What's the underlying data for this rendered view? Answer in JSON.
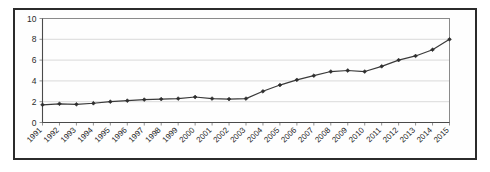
{
  "chart_data": {
    "type": "line",
    "title": "",
    "xlabel": "",
    "ylabel": "",
    "ylim": [
      0,
      10
    ],
    "yticks": [
      0,
      2,
      4,
      6,
      8,
      10
    ],
    "grid": true,
    "legend": "none",
    "categories": [
      "1991",
      "1992",
      "1993",
      "1994",
      "1995",
      "1996",
      "1997",
      "1998",
      "1999",
      "2000",
      "2001",
      "2002",
      "2003",
      "2004",
      "2005",
      "2006",
      "2007",
      "2008",
      "2009",
      "2010",
      "2011",
      "2012",
      "2013",
      "2014",
      "2015"
    ],
    "series": [
      {
        "name": "series-1",
        "marker": "diamond",
        "color": "#2e2e2e",
        "values": [
          1.7,
          1.8,
          1.75,
          1.85,
          2.0,
          2.1,
          2.2,
          2.25,
          2.3,
          2.45,
          2.3,
          2.25,
          2.3,
          3.0,
          3.6,
          4.1,
          4.5,
          4.9,
          5.0,
          4.9,
          5.4,
          6.0,
          6.4,
          7.0,
          8.0
        ]
      }
    ]
  },
  "axes": {
    "y_tick_labels": [
      "0",
      "2",
      "4",
      "6",
      "8",
      "10"
    ],
    "x_tick_labels": [
      "1991",
      "1992",
      "1993",
      "1994",
      "1995",
      "1996",
      "1997",
      "1998",
      "1999",
      "2000",
      "2001",
      "2002",
      "2003",
      "2004",
      "2005",
      "2006",
      "2007",
      "2008",
      "2009",
      "2010",
      "2011",
      "2012",
      "2013",
      "2014",
      "2015"
    ]
  },
  "colors": {
    "frame": "#2b2b2b",
    "grid": "#d0d0d0",
    "series": "#2e2e2e",
    "background": "#ffffff"
  }
}
